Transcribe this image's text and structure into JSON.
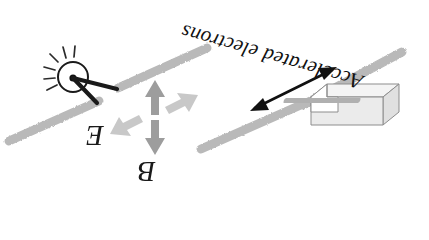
{
  "figure": {
    "orientation_note": "whole figure rendered upside-down (rotated 180 degrees)",
    "background_color": "#ffffff"
  },
  "labels": {
    "e_field": "E",
    "b_field": "B",
    "accelerated_electrons": "Accelerated electrons"
  },
  "colors": {
    "rod_gray": "#b9b9b9",
    "rod_gray_dark": "#a2a2a2",
    "arrow_gray_b": "#9d9d9d",
    "arrow_gray_e": "#c6c6c6",
    "arrow_black": "#111111",
    "electrode_black": "#1a1a1a",
    "box_fill": "#e6e6e6",
    "box_fill_light": "#f2f2f2",
    "box_stroke": "#8d8d8d",
    "text_color": "#1a1a1a"
  },
  "elements": {
    "spark_gap": {
      "name": "spark gap source",
      "center": [
        73,
        77
      ],
      "radius": 15,
      "spark_ray_count": 6
    },
    "electrodes": [
      {
        "name": "upper-right electrode",
        "from": [
          73,
          77
        ],
        "to": [
          116,
          89
        ]
      },
      {
        "name": "lower-left electrode",
        "from": [
          73,
          77
        ],
        "to": [
          96,
          103
        ]
      }
    ],
    "antenna_rods": [
      {
        "name": "upper-left rod",
        "from": [
          117,
          87
        ],
        "to": [
          206,
          48
        ]
      },
      {
        "name": "lower-left rod",
        "from": [
          8,
          140
        ],
        "to": [
          98,
          102
        ]
      },
      {
        "name": "lower-right rod",
        "from": [
          200,
          148
        ],
        "to": [
          300,
          105
        ]
      },
      {
        "name": "upper-right rod",
        "from": [
          302,
          106
        ],
        "to": [
          400,
          53
        ]
      },
      {
        "name": "horn-feed rod",
        "from": [
          295,
          103
        ],
        "to": [
          360,
          100
        ]
      }
    ],
    "field_arrows": {
      "b_field": {
        "name": "B field double arrow",
        "orientation": "vertical",
        "top": [
          155,
          82
        ],
        "bottom": [
          155,
          152
        ],
        "color": "#9d9d9d"
      },
      "e_field": {
        "name": "E field double arrow",
        "orientation": "diagonal up-right / down-left",
        "tip_upper_right": [
          196,
          96
        ],
        "tip_lower_left": [
          112,
          133
        ],
        "color": "#c6c6c6"
      }
    },
    "electron_arrow": {
      "name": "accelerated electrons double arrow",
      "from": [
        253,
        107
      ],
      "to": [
        334,
        68
      ],
      "color": "#111111"
    },
    "receiver_box": {
      "name": "receiving horn / waveguide box",
      "front_top_left": [
        320,
        82
      ],
      "width": 72,
      "height": 30,
      "depth": 18
    }
  }
}
